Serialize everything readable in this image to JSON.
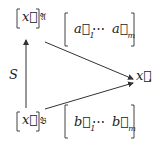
{
  "diagram": {
    "top_coord": {
      "vector": "x⃗",
      "basis": "𝔄"
    },
    "top_matrix": {
      "first": "a⃗",
      "first_index": "1",
      "ellipsis": "⋯",
      "last": "a⃗",
      "last_index": "m"
    },
    "bottom_coord": {
      "vector": "x⃗",
      "basis": "𝔅"
    },
    "bottom_matrix": {
      "first": "b⃗",
      "first_index": "1",
      "ellipsis": "⋯",
      "last": "b⃗",
      "last_index": "m"
    },
    "arrow_label": "S",
    "target": "x⃗",
    "target_punct": "."
  }
}
